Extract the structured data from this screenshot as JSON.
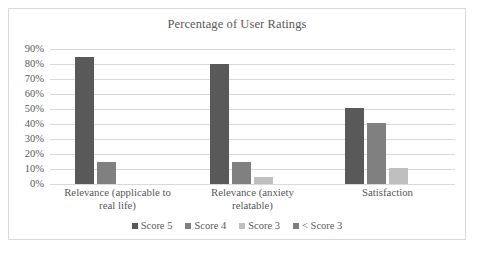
{
  "chart_data": {
    "type": "bar",
    "title": "Percentage of User Ratings",
    "xlabel": "",
    "ylabel": "",
    "ylim": [
      0,
      90
    ],
    "ytick_step": 10,
    "ytick_labels": [
      "90%",
      "80%",
      "70%",
      "60%",
      "50%",
      "40%",
      "30%",
      "20%",
      "10%",
      "0%"
    ],
    "ytick_values": [
      90,
      80,
      70,
      60,
      50,
      40,
      30,
      20,
      10,
      0
    ],
    "grid": true,
    "legend_position": "bottom",
    "categories": [
      "Relevance (applicable to real life)",
      "Relevance (anxiety relatable)",
      "Satisfaction"
    ],
    "category_lines": [
      [
        "Relevance (applicable to",
        "real life)"
      ],
      [
        "Relevance (anxiety",
        "relatable)"
      ],
      [
        "Satisfaction"
      ]
    ],
    "series": [
      {
        "name": "Score 5",
        "color": "#595959",
        "values": [
          85,
          80,
          51
        ]
      },
      {
        "name": "Score 4",
        "color": "#808080",
        "values": [
          15,
          15,
          41
        ]
      },
      {
        "name": "Score 3",
        "color": "#bfbfbf",
        "values": [
          0,
          5,
          11
        ]
      },
      {
        "name": "< Score 3",
        "color": "#7f7f7f",
        "values": [
          0,
          0,
          0
        ]
      }
    ]
  },
  "frame": {
    "border_color": "#d9d9d9",
    "background": "#ffffff"
  }
}
